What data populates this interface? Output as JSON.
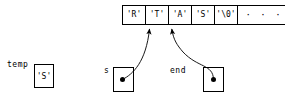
{
  "diagram": {
    "array": {
      "name": "character-array",
      "cells": [
        {
          "label": "'R'"
        },
        {
          "label": "'T'"
        },
        {
          "label": "'A'"
        },
        {
          "label": "'S'"
        },
        {
          "label": "'\\0'"
        },
        {
          "label": "· · ·"
        }
      ]
    },
    "variables": {
      "temp": {
        "label": "temp",
        "value": "'S'"
      },
      "s": {
        "label": "s",
        "value": ""
      },
      "end": {
        "label": "end",
        "value": ""
      }
    },
    "colors": {
      "stroke": "#000000",
      "background": "#ffffff",
      "dot": "#000000"
    }
  }
}
